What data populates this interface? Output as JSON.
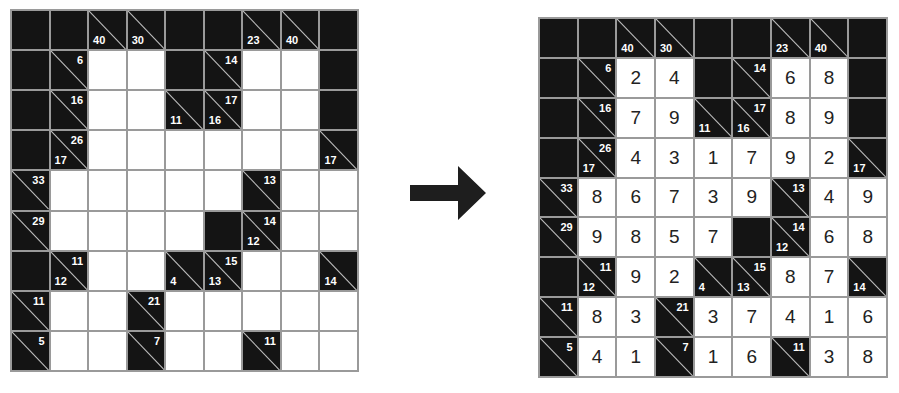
{
  "puzzle": {
    "grid_size": [
      9,
      9
    ],
    "layout": [
      [
        "B",
        "B",
        "C:40:",
        "C:30:",
        "B",
        "B",
        "C:23:",
        "C:40:",
        "B"
      ],
      [
        "B",
        "C::6",
        "W",
        "W",
        "B",
        "C::14",
        "W",
        "W",
        "B"
      ],
      [
        "B",
        "C::16",
        "W",
        "W",
        "C:11:",
        "C:16:17",
        "W",
        "W",
        "B"
      ],
      [
        "B",
        "C:17:26",
        "W",
        "W",
        "W",
        "W",
        "W",
        "W",
        "C:17:"
      ],
      [
        "C::33",
        "W",
        "W",
        "W",
        "W",
        "W",
        "C::13",
        "W",
        "W"
      ],
      [
        "C::29",
        "W",
        "W",
        "W",
        "W",
        "B",
        "C:12:14",
        "W",
        "W"
      ],
      [
        "B",
        "C:12:11",
        "W",
        "W",
        "C:4:",
        "C:13:15",
        "W",
        "W",
        "C:14:"
      ],
      [
        "C::11",
        "W",
        "W",
        "C::21",
        "W",
        "W",
        "W",
        "W",
        "W"
      ],
      [
        "C::5",
        "W",
        "W",
        "C::7",
        "W",
        "W",
        "C::11",
        "W",
        "W"
      ]
    ]
  },
  "solution": {
    "rows": [
      [
        null,
        null,
        null,
        null,
        null,
        null,
        null,
        null,
        null
      ],
      [
        null,
        null,
        "2",
        "4",
        null,
        null,
        "6",
        "8",
        null
      ],
      [
        null,
        null,
        "7",
        "9",
        null,
        null,
        "8",
        "9",
        null
      ],
      [
        null,
        null,
        "4",
        "3",
        "1",
        "7",
        "9",
        "2",
        null
      ],
      [
        null,
        "8",
        "6",
        "7",
        "3",
        "9",
        null,
        "4",
        "9"
      ],
      [
        null,
        "9",
        "8",
        "5",
        "7",
        null,
        null,
        "6",
        "8"
      ],
      [
        null,
        null,
        "9",
        "2",
        null,
        null,
        "8",
        "7",
        null
      ],
      [
        null,
        "8",
        "3",
        null,
        "3",
        "7",
        "4",
        "1",
        "6"
      ],
      [
        null,
        "4",
        "1",
        null,
        "1",
        "6",
        null,
        "3",
        "8"
      ]
    ]
  },
  "arrow": {
    "icon": "right-arrow-icon",
    "color": "#1e1e1e"
  },
  "colors": {
    "block": "#141414",
    "white_cell": "#ffffff",
    "grid_line": "#9a9a9a",
    "clue_text": "#ffffff",
    "digit_text": "#222222"
  }
}
